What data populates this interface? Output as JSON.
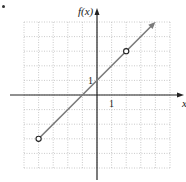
{
  "chart_data": {
    "type": "line",
    "title": "",
    "xlabel": "x",
    "ylabel": "f(x)",
    "xlim": [
      -5,
      5
    ],
    "ylim": [
      -5,
      5
    ],
    "grid": true,
    "tick_labels": {
      "x": [
        "1"
      ],
      "y": [
        "1"
      ]
    },
    "series": [
      {
        "name": "f(x) = x + 1",
        "x": [
          -4,
          -1,
          0,
          2,
          4
        ],
        "values": [
          -3,
          0,
          1,
          3,
          5
        ],
        "open_points": [
          [
            -4,
            -3
          ],
          [
            2,
            3
          ]
        ],
        "arrow_end": [
          4,
          5
        ]
      }
    ],
    "colors": {
      "line": "#7a7a7a",
      "axis": "#222222",
      "grid": "#bdbdbd"
    }
  },
  "labels": {
    "y_axis": "f(x)",
    "x_axis": "x",
    "x_tick": "1",
    "y_tick": "1"
  }
}
